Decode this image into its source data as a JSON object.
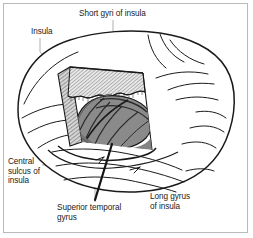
{
  "figure": {
    "kind": "anatomical-illustration",
    "background_color": "#ffffff",
    "frame_color": "#b9b9b9",
    "line_color": "#1a1a1a",
    "leader_color": "#9a9a9a",
    "insula_fill": "#8a8a8a",
    "insula_shadow": "#6f6f6f",
    "hatch_color": "#555555",
    "text_color": "#1a1a1a"
  },
  "labels": {
    "insula": "Insula",
    "short_gyri_of_insula": "Short gyri of insula",
    "central_sulcus_of_insula": "Central\nsulcus of\ninsula",
    "superior_temporal_gyrus": "Superior temporal\ngyrus",
    "long_gyrus_of_insula": "Long gyrus\nof insula"
  },
  "structures": [
    {
      "name": "insula",
      "label": "Insula"
    },
    {
      "name": "short-gyri-of-insula",
      "label": "Short gyri of insula"
    },
    {
      "name": "central-sulcus-of-insula",
      "label": "Central sulcus of insula"
    },
    {
      "name": "superior-temporal-gyrus",
      "label": "Superior temporal gyrus"
    },
    {
      "name": "long-gyrus-of-insula",
      "label": "Long gyrus of insula"
    }
  ]
}
